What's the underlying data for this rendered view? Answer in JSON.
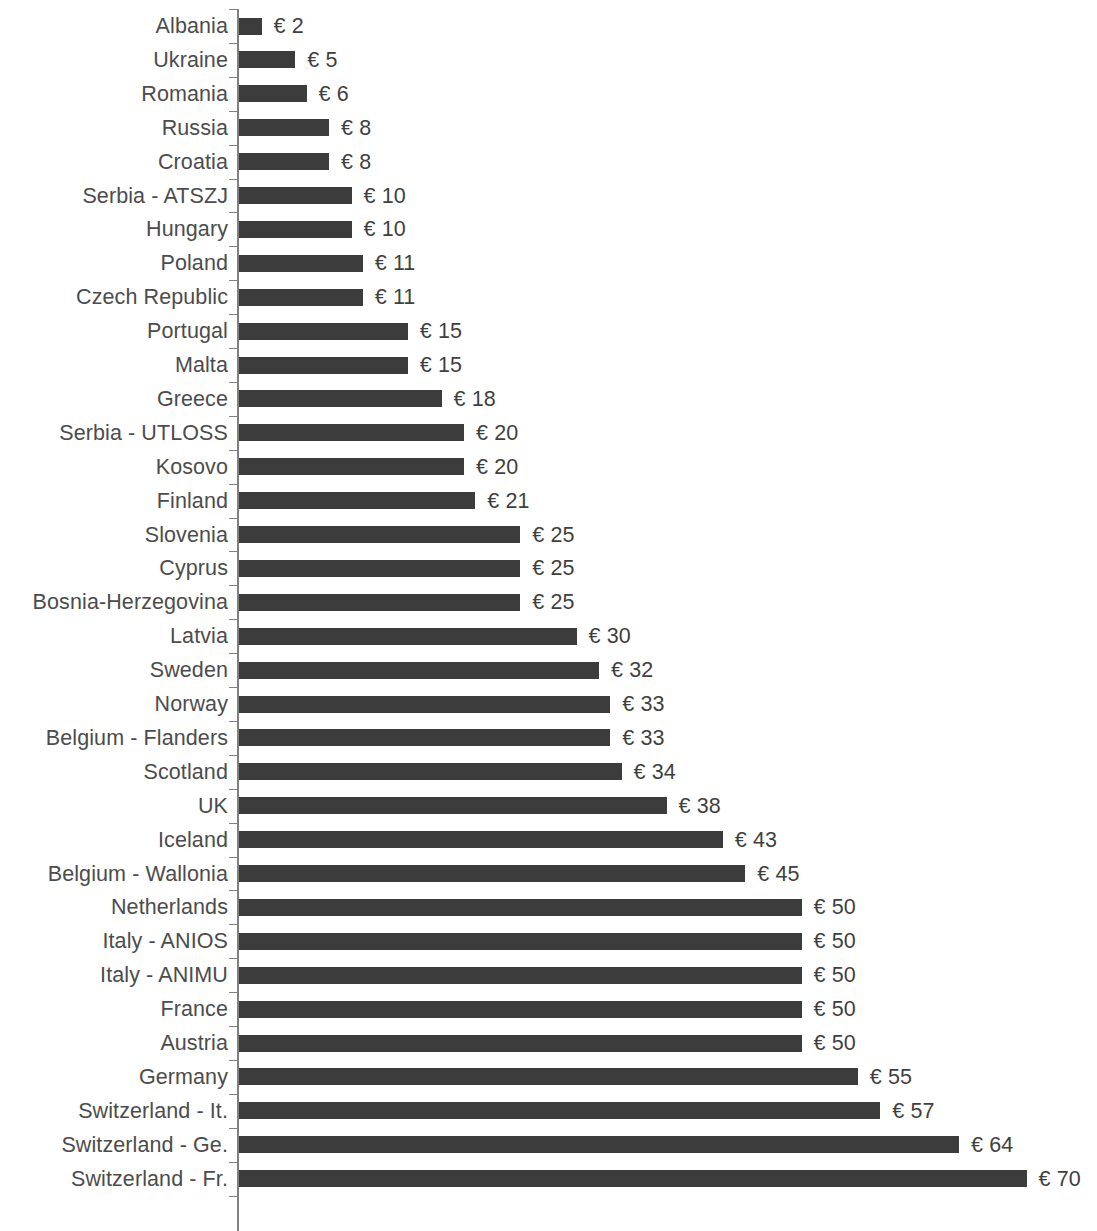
{
  "chart_data": {
    "type": "bar",
    "orientation": "horizontal",
    "title": "",
    "subtitle": "",
    "xlabel": "",
    "ylabel": "",
    "grid": false,
    "legend": null,
    "legend_position": "none",
    "currency_symbol": "€",
    "value_label_format": "€ {value}",
    "xlim": [
      0,
      70
    ],
    "bar_color": "#3c3c3c",
    "label_color": "#4c4c4c",
    "value_color": "#3f3f3f",
    "axis_color": "#808080",
    "background_color": "#ffffff",
    "categories": [
      "Albania",
      "Ukraine",
      "Romania",
      "Russia",
      "Croatia",
      "Serbia - ATSZJ",
      "Hungary",
      "Poland",
      "Czech Republic",
      "Portugal",
      "Malta",
      "Greece",
      "Serbia - UTLOSS",
      "Kosovo",
      "Finland",
      "Slovenia",
      "Cyprus",
      "Bosnia-Herzegovina",
      "Latvia",
      "Sweden",
      "Norway",
      "Belgium - Flanders",
      "Scotland",
      "UK",
      "Iceland",
      "Belgium - Wallonia",
      "Netherlands",
      "Italy - ANIOS",
      "Italy - ANIMU",
      "France",
      "Austria",
      "Germany",
      "Switzerland - It.",
      "Switzerland - Ge.",
      "Switzerland - Fr."
    ],
    "values": [
      2,
      5,
      6,
      8,
      8,
      10,
      10,
      11,
      11,
      15,
      15,
      18,
      20,
      20,
      21,
      25,
      25,
      25,
      30,
      32,
      33,
      33,
      34,
      38,
      43,
      45,
      50,
      50,
      50,
      50,
      50,
      55,
      57,
      64,
      70
    ],
    "value_labels": [
      "€ 2",
      "€ 5",
      "€ 6",
      "€ 8",
      "€ 8",
      "€ 10",
      "€ 10",
      "€ 11",
      "€ 11",
      "€ 15",
      "€ 15",
      "€ 18",
      "€ 20",
      "€ 20",
      "€ 21",
      "€ 25",
      "€ 25",
      "€ 25",
      "€ 30",
      "€ 32",
      "€ 33",
      "€ 33",
      "€ 34",
      "€ 38",
      "€ 43",
      "€ 45",
      "€ 50",
      "€ 50",
      "€ 50",
      "€ 50",
      "€ 50",
      "€ 55",
      "€ 57",
      "€ 64",
      "€ 70"
    ]
  },
  "layout": {
    "axis_x_px": 239,
    "px_per_unit": 11.25,
    "first_row_center_y_px": 26,
    "row_pitch_px": 33.9,
    "bar_height_px": 17,
    "value_gap_px": 12
  }
}
